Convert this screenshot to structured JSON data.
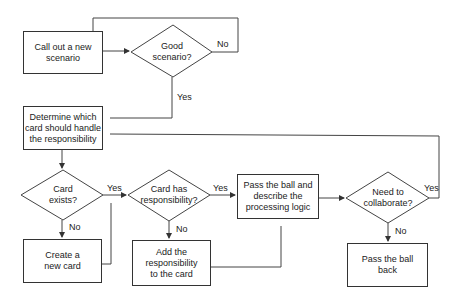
{
  "diagram": {
    "type": "flowchart",
    "nodes": {
      "call_out": {
        "shape": "process",
        "text": "Call out a new scenario"
      },
      "good_scenario": {
        "shape": "decision",
        "text": "Good scenario?"
      },
      "determine_card": {
        "shape": "process",
        "text": "Determine which card should handle the responsibility"
      },
      "card_exists": {
        "shape": "decision",
        "text": "Card exists?"
      },
      "create_card": {
        "shape": "process",
        "text": "Create a new card"
      },
      "card_has_resp": {
        "shape": "decision",
        "text": "Card has responsibility?"
      },
      "add_resp": {
        "shape": "process",
        "text": "Add the responsibility to the card"
      },
      "pass_ball": {
        "shape": "process",
        "text": "Pass the ball and describe the processing logic"
      },
      "need_collab": {
        "shape": "decision",
        "text": "Need to collaborate?"
      },
      "pass_back": {
        "shape": "process",
        "text": "Pass the ball back"
      }
    },
    "edge_labels": {
      "good_no": "No",
      "good_yes": "Yes",
      "exists_yes": "Yes",
      "exists_no": "No",
      "has_yes": "Yes",
      "has_no": "No",
      "collab_yes": "Yes",
      "collab_no": "No"
    },
    "edges": [
      {
        "from": "call_out",
        "to": "good_scenario"
      },
      {
        "from": "good_scenario",
        "to": "call_out",
        "label": "No"
      },
      {
        "from": "good_scenario",
        "to": "determine_card",
        "label": "Yes"
      },
      {
        "from": "determine_card",
        "to": "card_exists"
      },
      {
        "from": "card_exists",
        "to": "card_has_resp",
        "label": "Yes"
      },
      {
        "from": "card_exists",
        "to": "create_card",
        "label": "No"
      },
      {
        "from": "create_card",
        "to": "card_has_resp"
      },
      {
        "from": "card_has_resp",
        "to": "pass_ball",
        "label": "Yes"
      },
      {
        "from": "card_has_resp",
        "to": "add_resp",
        "label": "No"
      },
      {
        "from": "add_resp",
        "to": "pass_ball"
      },
      {
        "from": "pass_ball",
        "to": "need_collab"
      },
      {
        "from": "need_collab",
        "to": "determine_card",
        "label": "Yes"
      },
      {
        "from": "need_collab",
        "to": "pass_back",
        "label": "No"
      }
    ]
  }
}
